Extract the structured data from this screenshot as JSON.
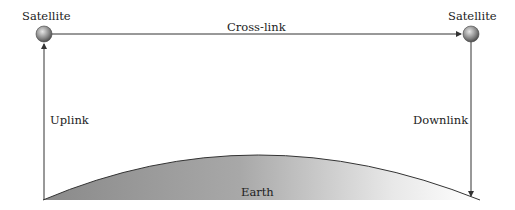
{
  "diagram": {
    "satellite_left": {
      "label": "Satellite",
      "x": 44,
      "y": 34
    },
    "satellite_right": {
      "label": "Satellite",
      "x": 471,
      "y": 34
    },
    "crosslink": {
      "label": "Cross-link"
    },
    "uplink": {
      "label": "Uplink"
    },
    "downlink": {
      "label": "Downlink"
    },
    "earth": {
      "label": "Earth"
    },
    "colors": {
      "line": "#333333",
      "earth_dark": "#8a8a8a",
      "earth_light": "#ffffff",
      "satellite_dark": "#555555",
      "satellite_light": "#e6e6e6"
    }
  }
}
